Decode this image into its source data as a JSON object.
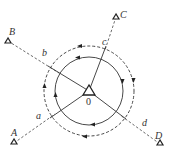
{
  "diagram": {
    "title": "",
    "center": {
      "label": "0",
      "x": 89,
      "y": 91
    },
    "circles": {
      "inner": {
        "style": "solid",
        "radius": 34
      },
      "outer": {
        "style": "dashed",
        "radius": 45
      }
    },
    "stations": [
      {
        "id": "A",
        "label": "A",
        "x": 14,
        "y": 143,
        "label_x": 11,
        "label_y": 136
      },
      {
        "id": "B",
        "label": "B",
        "x": 8,
        "y": 41,
        "label_x": 10,
        "label_y": 35
      },
      {
        "id": "C",
        "label": "C",
        "x": 116,
        "y": 17,
        "label_x": 121,
        "label_y": 17
      },
      {
        "id": "D",
        "label": "D",
        "x": 160,
        "y": 144,
        "label_x": 156,
        "label_y": 138
      }
    ],
    "segment_labels": [
      {
        "label": "a",
        "x": 37,
        "y": 118
      },
      {
        "label": "b",
        "x": 43,
        "y": 55
      },
      {
        "label": "c",
        "x": 103,
        "y": 44
      },
      {
        "label": "d",
        "x": 143,
        "y": 125
      }
    ],
    "colors": {
      "line": "#333333",
      "background": "#ffffff"
    }
  }
}
